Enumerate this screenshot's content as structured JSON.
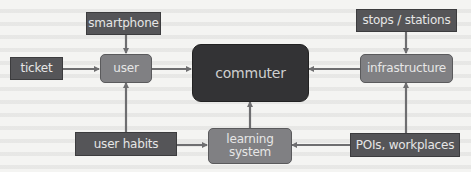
{
  "diagram": {
    "type": "flow diagram",
    "colors": {
      "input_box": "#555558",
      "intermediate_box": "#808083",
      "central_box": "#333335",
      "arrow": "#6e6e70",
      "text": "#e6e6e6"
    },
    "nodes": {
      "smartphone": "smartphone",
      "ticket": "ticket",
      "user": "user",
      "commuter": "commuter",
      "stops_stations": "stops / stations",
      "infrastructure": "infrastructure",
      "user_habits": "user habits",
      "learning_system": "learning system",
      "pois_workplaces": "POIs, workplaces"
    },
    "edges": [
      {
        "from": "smartphone",
        "to": "user"
      },
      {
        "from": "ticket",
        "to": "user"
      },
      {
        "from": "user_habits",
        "to": "user"
      },
      {
        "from": "user",
        "to": "commuter"
      },
      {
        "from": "user_habits",
        "to": "learning_system"
      },
      {
        "from": "learning_system",
        "to": "commuter"
      },
      {
        "from": "stops_stations",
        "to": "infrastructure"
      },
      {
        "from": "pois_workplaces",
        "to": "infrastructure"
      },
      {
        "from": "pois_workplaces",
        "to": "learning_system"
      },
      {
        "from": "infrastructure",
        "to": "commuter"
      }
    ]
  }
}
